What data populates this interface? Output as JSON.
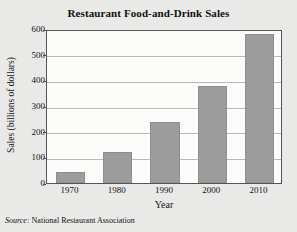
{
  "chart_data": {
    "type": "bar",
    "title": "Restaurant Food-and-Drink Sales",
    "xlabel": "Year",
    "ylabel": "Sales (billions of dollars)",
    "categories": [
      "1970",
      "1980",
      "1990",
      "2000",
      "2010"
    ],
    "values": [
      42,
      120,
      238,
      378,
      580
    ],
    "ylim": [
      0,
      600
    ],
    "yticks": [
      0,
      100,
      200,
      300,
      400,
      500,
      600
    ],
    "ytick_labels": [
      "0",
      "100",
      "200",
      "300",
      "400",
      "500",
      "600"
    ],
    "grid": true,
    "legend": null,
    "bar_color": "#9c9c9c",
    "plot_background": "#fcfcfb",
    "figure_background": "#e9e9e7",
    "axis_color": "#555555",
    "gridline_color": "#b9b9b9"
  },
  "source": {
    "lead": "Source:",
    "text": "National Restaurant Association"
  }
}
